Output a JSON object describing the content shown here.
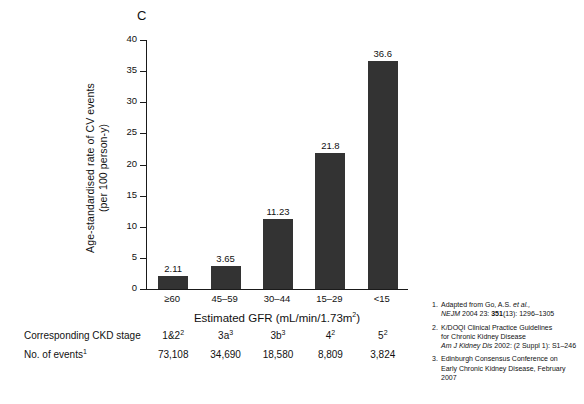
{
  "panel": {
    "label": "C"
  },
  "chart_data": {
    "type": "bar",
    "title": "",
    "xlabel": "Estimated GFR (mL/min/1.73m2)",
    "ylabel": "Age-standardised rate of CV events (per 100 person-y)",
    "categories": [
      "≥60",
      "45–59",
      "30–44",
      "15–29",
      "<15"
    ],
    "values": [
      2.11,
      3.65,
      11.23,
      21.8,
      36.6
    ],
    "value_labels": [
      "2.11",
      "3.65",
      "11.23",
      "21.8",
      "36.6"
    ],
    "ylim": [
      0,
      40
    ],
    "yticks": [
      0,
      5,
      10,
      15,
      20,
      25,
      30,
      35,
      40
    ],
    "ytick_labels": [
      "0",
      "5",
      "10",
      "15",
      "20",
      "25",
      "30",
      "35",
      "40"
    ],
    "grid": false,
    "legend": "none",
    "bar_color": "#333333"
  },
  "axis": {
    "x_title_main": "Estimated GFR (mL/min/1.73m",
    "x_title_sup": "2",
    "x_title_end": ")",
    "y_title_line1": "Age-standardised rate of CV events",
    "y_title_line2": "(per 100 person-y)"
  },
  "table": {
    "rows": [
      {
        "label": "Corresponding CKD stage",
        "label_sup": "",
        "cells": [
          {
            "text": "1&2",
            "sup": "2"
          },
          {
            "text": "3a",
            "sup": "3"
          },
          {
            "text": "3b",
            "sup": "3"
          },
          {
            "text": "4",
            "sup": "2"
          },
          {
            "text": "5",
            "sup": "2"
          }
        ]
      },
      {
        "label": "No. of events",
        "label_sup": "1",
        "cells": [
          {
            "text": "73,108",
            "sup": ""
          },
          {
            "text": "34,690",
            "sup": ""
          },
          {
            "text": "18,580",
            "sup": ""
          },
          {
            "text": "8,809",
            "sup": ""
          },
          {
            "text": "3,824",
            "sup": ""
          }
        ]
      }
    ]
  },
  "footnotes": [
    {
      "num": "1.",
      "line1_plain": "Adapted from Go, A.S. ",
      "line1_italic": "et al.,",
      "line2_italic": "NEJM",
      "line2_plain": " 2004 23: ",
      "line2_bold": "351",
      "line2_tail": "(13): 1296–1305"
    },
    {
      "num": "2.",
      "line1_plain": "K/DOQI  Clinical Practice Guidelines",
      "line2_plain": "for Chronic Kidney Disease",
      "line3_italic": "Am J Kidney Dis",
      "line3_plain": " 2002: (2 Suppl 1): S1–246"
    },
    {
      "num": "3.",
      "line1_plain": "Edinburgh Consensus Conference on",
      "line2_plain": "Early Chronic Kidney Disease, February 2007"
    }
  ]
}
